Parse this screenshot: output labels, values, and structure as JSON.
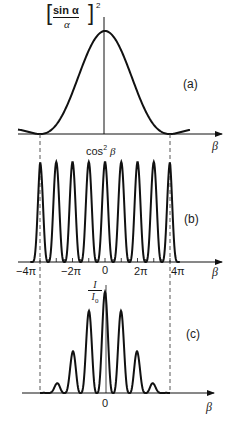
{
  "figure": {
    "panels": [
      {
        "id": "a",
        "label": "(a)",
        "ylabel_func": "sin α",
        "ylabel_den": "α",
        "ylabel_exp": "2",
        "xlabel": "β"
      },
      {
        "id": "b",
        "label": "(b)",
        "ylabel": "cos",
        "ylabel_exp": "2",
        "ylabel_var": "β",
        "xlabel": "β",
        "ticks": [
          "−4π",
          "−2π",
          "0",
          "2π",
          "4π"
        ]
      },
      {
        "id": "c",
        "label": "(c)",
        "ylabel_num": "I",
        "ylabel_den": "I",
        "ylabel_den_sub": "0",
        "xlabel": "β",
        "ticks": [
          "0"
        ]
      }
    ],
    "colors": {
      "curve": "#111111",
      "axis": "#111111",
      "dashed": "#444444"
    }
  },
  "chart_data": [
    {
      "type": "line",
      "title": "(a)",
      "ylabel": "[sin α / α]^2",
      "xlabel": "β",
      "description": "Single-slit diffraction envelope; central maximum at β=0, zeros at β=±4π",
      "x": [
        -4.8,
        -4,
        -2,
        0,
        2,
        4,
        4.8
      ],
      "y_rel": [
        0.05,
        0.0,
        0.4,
        1.0,
        0.4,
        0.0,
        0.05
      ]
    },
    {
      "type": "line",
      "title": "(b)",
      "ylabel": "cos^2 β",
      "xlabel": "β",
      "description": "Interference fringes, peaks at every multiple of π from −4π to 4π",
      "tick_labels": [
        "−4π",
        "−2π",
        "0",
        "2π",
        "4π"
      ],
      "peak_count": 9
    },
    {
      "type": "line",
      "title": "(c)",
      "ylabel": "I/I0",
      "xlabel": "β",
      "description": "Product of (a) and (b): central peak highest, side peaks decreasing",
      "tick_labels": [
        "0"
      ]
    }
  ]
}
